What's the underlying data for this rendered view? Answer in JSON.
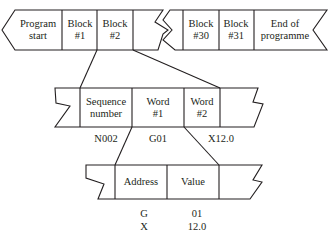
{
  "program_row": {
    "cells": [
      {
        "line1": "Program",
        "line2": "start"
      },
      {
        "line1": "Block",
        "line2": "#1"
      },
      {
        "line1": "Block",
        "line2": "#2"
      },
      {
        "line1": "Block",
        "line2": "#30"
      },
      {
        "line1": "Block",
        "line2": "#31"
      },
      {
        "line1": "End of",
        "line2": "programme"
      }
    ]
  },
  "block_row": {
    "cells": [
      {
        "line1": "Sequence",
        "line2": "number"
      },
      {
        "line1": "Word",
        "line2": "#1"
      },
      {
        "line1": "Word",
        "line2": "#2"
      }
    ],
    "examples": [
      "N002",
      "G01",
      "X12.0"
    ]
  },
  "word_row": {
    "cells": [
      {
        "line1": "Address"
      },
      {
        "line1": "Value"
      }
    ],
    "examples": [
      {
        "address": "G",
        "value": "01"
      },
      {
        "address": "X",
        "value": "12.0"
      }
    ]
  }
}
